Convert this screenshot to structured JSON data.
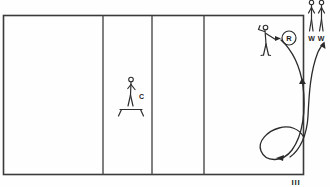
{
  "diagram": {
    "caption": "III",
    "court": {
      "name": "court-rectangle",
      "x": 3,
      "y": 15,
      "width": 301,
      "height": 160,
      "border_color": "#3a3a3a",
      "fill_color": "#ffffff",
      "divider_positions": [
        103,
        152,
        204
      ],
      "zone_count": 4
    },
    "players": [
      {
        "id": "coach",
        "label": "C",
        "role": "coach-on-platform",
        "x": 131,
        "y": 78,
        "has_platform": true
      },
      {
        "id": "receiver",
        "label": "",
        "role": "passer-receiver",
        "x": 266,
        "y": 30,
        "has_platform": false
      },
      {
        "id": "waiting-1",
        "label": "W",
        "role": "waiting-player",
        "x": 312,
        "y": 6,
        "has_platform": false
      },
      {
        "id": "waiting-2",
        "label": "W",
        "role": "waiting-player",
        "x": 322,
        "y": 6,
        "has_platform": false
      }
    ],
    "ball": {
      "label": "R",
      "name": "ball-marker-r",
      "cx": 289,
      "cy": 38,
      "r": 7
    },
    "paths": [
      {
        "id": "ball-flight-path",
        "name": "ball-trajectory-loop",
        "description": "Ball travels from receiver down and loops around to the bottom left",
        "arrow_direction": "left"
      },
      {
        "id": "player-movement-path",
        "name": "player-movement-arc",
        "description": "Player movement arc rising to the upper right outside the court",
        "arrow_direction": "up-right"
      }
    ],
    "colors": {
      "ink": "#2b2b2b",
      "court_border": "#3a3a3a",
      "divider": "#4a4a4a",
      "background": "#ffffff"
    }
  }
}
